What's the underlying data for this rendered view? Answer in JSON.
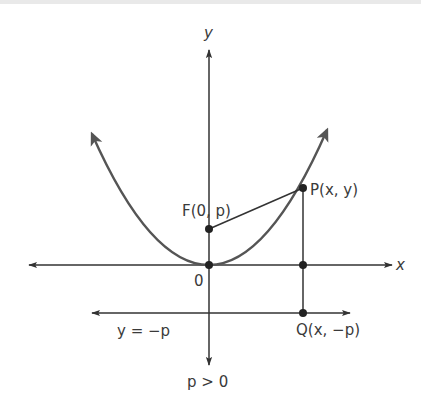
{
  "figure": {
    "colors": {
      "background": "#ffffff",
      "axes": "#333333",
      "curve": "#555555",
      "points": "#222222",
      "text": "#3a3a3a"
    },
    "axes": {
      "x_label": "x",
      "y_label": "y",
      "origin_label": "0"
    },
    "points": {
      "focus": {
        "label": "F(0, p)"
      },
      "point_on_parabola": {
        "label": "P(x, y)"
      },
      "directrix_point": {
        "label": "Q(x, −p)"
      }
    },
    "directrix": {
      "label": "y = −p"
    },
    "condition": {
      "label": "p > 0"
    }
  }
}
